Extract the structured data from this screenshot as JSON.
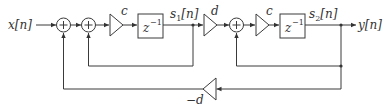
{
  "diagram": {
    "type": "signal-flow-block-diagram",
    "input_label": "x[n]",
    "output_label": "y[n]",
    "state_labels": {
      "s1": "s",
      "s1_sub": "1",
      "s1_suffix": "[n]",
      "s2": "s",
      "s2_sub": "2",
      "s2_suffix": "[n]"
    },
    "gains": {
      "c1": "c",
      "d": "d",
      "c2": "c",
      "neg_d": "−d"
    },
    "delays": {
      "z1": "z",
      "z1_exp": "−1",
      "z2": "z",
      "z2_exp": "−1"
    },
    "adder_symbol": "+",
    "nodes": [
      "x[n]",
      "adder-1",
      "adder-2",
      "gain-c-1",
      "delay-z-1",
      "s1[n]",
      "gain-d",
      "adder-3",
      "gain-c-2",
      "delay-z-2",
      "s2[n]",
      "y[n]",
      "gain-neg-d"
    ],
    "edges": [
      [
        "x[n]",
        "adder-1"
      ],
      [
        "adder-1",
        "adder-2"
      ],
      [
        "adder-2",
        "gain-c-1"
      ],
      [
        "gain-c-1",
        "delay-z-1"
      ],
      [
        "delay-z-1",
        "s1[n]"
      ],
      [
        "s1[n]",
        "gain-d"
      ],
      [
        "s1[n]",
        "adder-2"
      ],
      [
        "gain-d",
        "adder-3"
      ],
      [
        "adder-3",
        "gain-c-2"
      ],
      [
        "gain-c-2",
        "delay-z-2"
      ],
      [
        "delay-z-2",
        "s2[n]"
      ],
      [
        "s2[n]",
        "y[n]"
      ],
      [
        "s2[n]",
        "adder-3"
      ],
      [
        "s2[n]",
        "gain-neg-d"
      ],
      [
        "gain-neg-d",
        "adder-1"
      ]
    ]
  }
}
